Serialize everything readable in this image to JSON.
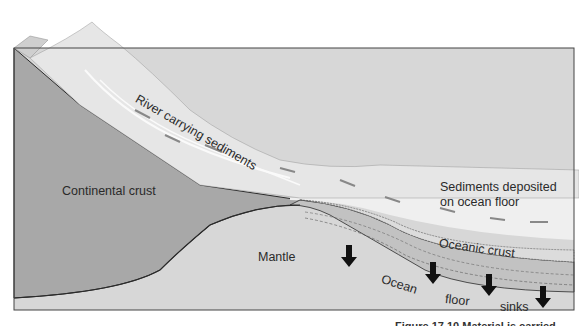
{
  "labels": {
    "river": "River carrying sediments",
    "continental_crust": "Continental crust",
    "sediments": "Sediments deposited",
    "sediments_line2": "on ocean floor",
    "mantle": "Mantle",
    "oceanic_crust": "Oceanic crust",
    "ocean": "Ocean",
    "floor": "floor",
    "sinks": "sinks"
  },
  "caption": "Figure 17.10 Material is carried",
  "colors": {
    "continental_crust": "#a9a9a9",
    "mantle": "#d6d6d6",
    "ocean_water": "#ededed",
    "mountain": "#e4e4e4",
    "outline": "#2b2b2b"
  },
  "arrows": {
    "sinking_count": 4
  }
}
